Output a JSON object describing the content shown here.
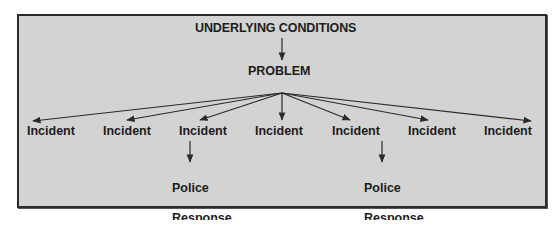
{
  "diagram": {
    "root": {
      "label": "UNDERLYING CONDITIONS"
    },
    "problem": {
      "label": "PROBLEM"
    },
    "incidents": [
      {
        "label": "Incident",
        "left": 27,
        "has_response": false
      },
      {
        "label": "Incident",
        "left": 103,
        "has_response": false
      },
      {
        "label": "Incident",
        "left": 179,
        "has_response": true
      },
      {
        "label": "Incident",
        "left": 255,
        "has_response": false
      },
      {
        "label": "Incident",
        "left": 332,
        "has_response": true
      },
      {
        "label": "Incident",
        "left": 408,
        "has_response": false
      },
      {
        "label": "Incident",
        "left": 484,
        "has_response": false
      }
    ],
    "responses": [
      {
        "line1": "Police",
        "line2": "Response",
        "under_incident": 3
      },
      {
        "line1": "Police",
        "line2": "Response",
        "under_incident": 5
      }
    ],
    "edges": [
      {
        "from": "UNDERLYING CONDITIONS",
        "to": "PROBLEM"
      },
      {
        "from": "PROBLEM",
        "to": "Incident 1"
      },
      {
        "from": "PROBLEM",
        "to": "Incident 2"
      },
      {
        "from": "PROBLEM",
        "to": "Incident 3"
      },
      {
        "from": "PROBLEM",
        "to": "Incident 4"
      },
      {
        "from": "PROBLEM",
        "to": "Incident 5"
      },
      {
        "from": "PROBLEM",
        "to": "Incident 6"
      },
      {
        "from": "PROBLEM",
        "to": "Incident 7"
      },
      {
        "from": "Incident 3",
        "to": "Police Response 1"
      },
      {
        "from": "Incident 5",
        "to": "Police Response 2"
      }
    ],
    "colors": {
      "background": "#d3d3d3",
      "border": "#2a2a2a",
      "text": "#1c1c1c",
      "line": "#2a2a2a"
    }
  }
}
